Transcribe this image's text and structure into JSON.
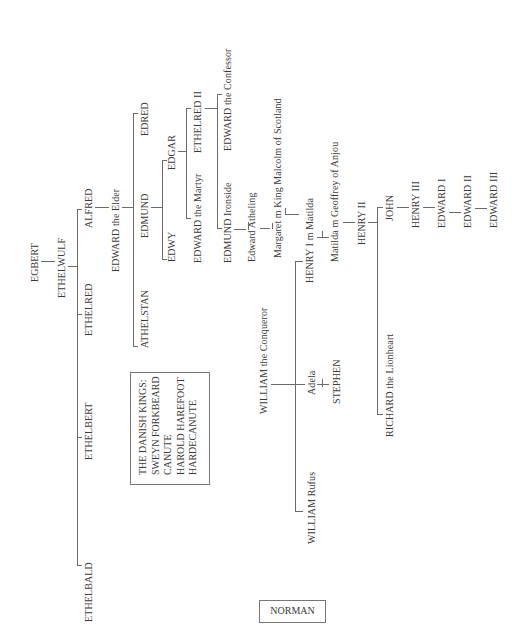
{
  "orientation": "rotated -90deg",
  "people": {
    "egbert": "EGBERT",
    "ethelwulf": "ETHELWULF",
    "alfred": "ALFRED",
    "ethelred": "ETHELRED",
    "ethelbert": "ETHELBERT",
    "ethelbald": "ETHELBALD",
    "edward_elder": "EDWARD the Elder",
    "edred": "EDRED",
    "edmund": "EDMUND",
    "athelstan": "ATHELSTAN",
    "edgar": "EDGAR",
    "edwy": "EDWY",
    "ethelred_ii": "ETHELRED II",
    "edward_martyr": "EDWARD the Martyr",
    "edward_confessor": "EDWARD the Confessor",
    "edmund_ironside": "EDMUND Ironside",
    "edward_atheling": "Edward Atheling",
    "margaret": "Margaret m King Malcolm of Scotland",
    "henry_i": "HENRY I m Matilda",
    "matilda": "Matilda m Geoffrey of Anjou",
    "henry_ii": "HENRY II",
    "john": "JOHN",
    "richard": "RICHARD the Lionheart",
    "henry_iii": "HENRY III",
    "edward_i": "EDWARD I",
    "edward_ii": "EDWARD II",
    "edward_iii": "EDWARD III",
    "william_conqueror": "WILLIAM the Conqueror",
    "adela": "Adela",
    "stephen": "STEPHEN",
    "william_rufus": "WILLIAM Rufus"
  },
  "danish_box": {
    "heading": "THE DANISH KINGS:",
    "kings": [
      "SWEYN FORKBEARD",
      "CANUTE",
      "HAROLD HAREFOOT",
      "HARDECANUTE"
    ]
  },
  "legend": {
    "norman_label": "NORMAN"
  }
}
